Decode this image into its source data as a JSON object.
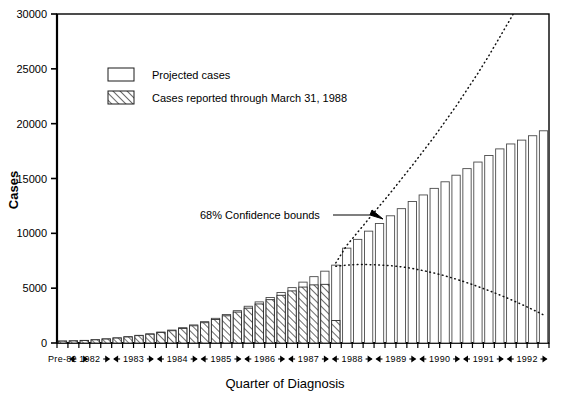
{
  "chart_data": {
    "type": "bar",
    "title": "",
    "xlabel": "Quarter of Diagnosis",
    "ylabel": "Cases",
    "ylim": [
      0,
      30000
    ],
    "ytick_labels": [
      "0",
      "5000",
      "10000",
      "15000",
      "20000",
      "25000",
      "30000"
    ],
    "ytick_values": [
      0,
      5000,
      10000,
      15000,
      20000,
      25000,
      30000
    ],
    "grid": false,
    "legend_position": "upper-left-inside",
    "legend": [
      {
        "key": "projected",
        "label": "Projected cases",
        "swatch": "open-rectangle"
      },
      {
        "key": "reported",
        "label": "Cases reported through March 31, 1988",
        "swatch": "hatched-rectangle"
      }
    ],
    "annotations": [
      {
        "text": "68% Confidence bounds",
        "x_index": 24,
        "y": 11800,
        "arrow_to_index": 25
      }
    ],
    "x_group_labels": [
      "Pre-82",
      "1982",
      "1983",
      "1984",
      "1985",
      "1986",
      "1987",
      "1988",
      "1989",
      "1990",
      "1991",
      "1992"
    ],
    "x_group_spans": [
      1,
      4,
      4,
      4,
      4,
      4,
      4,
      4,
      4,
      4,
      4,
      4
    ],
    "categories": [
      "Pre-82",
      "1982Q1",
      "1982Q2",
      "1982Q3",
      "1982Q4",
      "1983Q1",
      "1983Q2",
      "1983Q3",
      "1983Q4",
      "1984Q1",
      "1984Q2",
      "1984Q3",
      "1984Q4",
      "1985Q1",
      "1985Q2",
      "1985Q3",
      "1985Q4",
      "1986Q1",
      "1986Q2",
      "1986Q3",
      "1986Q4",
      "1987Q1",
      "1987Q2",
      "1987Q3",
      "1987Q4",
      "1988Q1",
      "1988Q2",
      "1988Q3",
      "1988Q4",
      "1989Q1",
      "1989Q2",
      "1989Q3",
      "1989Q4",
      "1990Q1",
      "1990Q2",
      "1990Q3",
      "1990Q4",
      "1991Q1",
      "1991Q2",
      "1991Q3",
      "1991Q4",
      "1992Q1",
      "1992Q2",
      "1992Q3",
      "1992Q4"
    ],
    "series": [
      {
        "name": "Projected cases",
        "values": [
          180,
          200,
          240,
          300,
          380,
          470,
          580,
          700,
          840,
          1000,
          1180,
          1400,
          1650,
          1950,
          2250,
          2600,
          2950,
          3350,
          3750,
          4150,
          4600,
          5050,
          5550,
          6050,
          6550,
          7100,
          8650,
          9450,
          10200,
          10900,
          11600,
          12250,
          12900,
          13500,
          14100,
          14700,
          15300,
          15900,
          16500,
          17100,
          17700,
          18150,
          18500,
          18900,
          19350
        ]
      },
      {
        "name": "Cases reported through March 31, 1988",
        "values": [
          170,
          190,
          230,
          290,
          360,
          450,
          550,
          670,
          800,
          950,
          1120,
          1330,
          1570,
          1850,
          2150,
          2480,
          2820,
          3180,
          3560,
          3950,
          4350,
          4750,
          5100,
          5300,
          5350,
          2050,
          0,
          0,
          0,
          0,
          0,
          0,
          0,
          0,
          0,
          0,
          0,
          0,
          0,
          0,
          0,
          0,
          0,
          0,
          0
        ]
      }
    ],
    "confidence_bounds": {
      "label": "68% Confidence bounds",
      "start_index": 25,
      "upper": [
        7300,
        8900,
        10100,
        11300,
        12500,
        13700,
        14950,
        16200,
        17500,
        18800,
        20200,
        21600,
        23100,
        24600,
        26200,
        27900,
        29600,
        31400,
        33300,
        35300
      ],
      "lower": [
        7000,
        7100,
        7150,
        7150,
        7120,
        7050,
        6950,
        6800,
        6600,
        6380,
        6120,
        5830,
        5500,
        5150,
        4780,
        4380,
        3960,
        3520,
        3050,
        2560
      ]
    }
  },
  "colors": {
    "axis": "#000000",
    "bar_outline": "#4a4a4a",
    "bar_fill": "#ffffff",
    "hatch": "#1a1a1a",
    "bounds": "#111111",
    "background": "#ffffff"
  }
}
